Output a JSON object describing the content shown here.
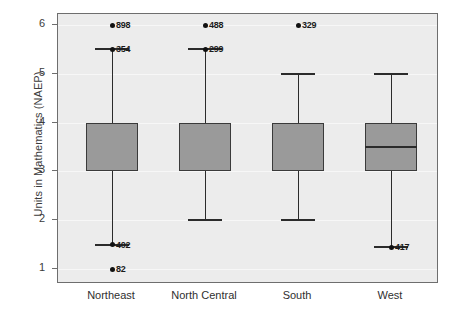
{
  "chart_data": {
    "type": "box",
    "title": "",
    "xlabel": "",
    "ylabel": "Units in Mathematics (NAEP)",
    "ylim": [
      0.75,
      6.2
    ],
    "yticks": [
      1,
      2,
      3,
      4,
      5,
      6
    ],
    "ytick_labels": [
      "1",
      "2",
      "3",
      "4",
      "5",
      "6"
    ],
    "grid": true,
    "legend": "none",
    "categories": [
      "Northeast",
      "North Central",
      "South",
      "West"
    ],
    "boxes": [
      {
        "category": "Northeast",
        "whisker_low": 1.5,
        "q1": 3.0,
        "median": 4.0,
        "q3": 4.0,
        "whisker_high": 5.5,
        "outliers": [
          {
            "value": 6.0,
            "label": "898"
          },
          {
            "value": 5.5,
            "label": "354"
          },
          {
            "value": 1.5,
            "label": "402"
          },
          {
            "value": 1.0,
            "label": "82"
          }
        ]
      },
      {
        "category": "North Central",
        "whisker_low": 2.0,
        "q1": 3.0,
        "median": 4.0,
        "q3": 4.0,
        "whisker_high": 5.5,
        "outliers": [
          {
            "value": 6.0,
            "label": "488"
          },
          {
            "value": 5.5,
            "label": "299"
          }
        ]
      },
      {
        "category": "South",
        "whisker_low": 2.0,
        "q1": 3.0,
        "median": 4.0,
        "q3": 4.0,
        "whisker_high": 5.0,
        "outliers": [
          {
            "value": 6.0,
            "label": "329"
          }
        ]
      },
      {
        "category": "West",
        "whisker_low": 1.45,
        "q1": 3.0,
        "median": 3.5,
        "q3": 4.0,
        "whisker_high": 5.0,
        "outliers": [
          {
            "value": 1.45,
            "label": "417"
          }
        ]
      }
    ],
    "colors": {
      "box_fill": "#9a9a9a",
      "box_edge": "#3a3a3a",
      "whisker": "#2b2b2b",
      "outlier": "#111111",
      "plot_background": "#ececec",
      "frame": "#6e6e6e",
      "gridline": "#f7f7f7",
      "text": "#2f2f2f"
    }
  }
}
